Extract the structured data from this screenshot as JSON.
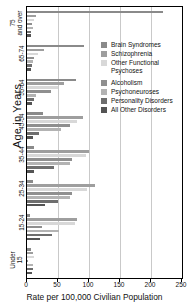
{
  "chart_data": {
    "type": "bar",
    "orientation": "horizontal",
    "title": "",
    "xlabel": "Rate per 100,000 Civilian Population",
    "ylabel": "Age in Years",
    "xlim": [
      0,
      250
    ],
    "xticks": [
      0,
      50,
      100,
      150,
      200,
      250
    ],
    "grid": "vertical",
    "legend_position": "upper-right-inside",
    "categories": [
      "75 and over",
      "65-74",
      "55-64",
      "45-54",
      "35-44",
      "25-34",
      "15-24",
      "Under 15"
    ],
    "series": [
      {
        "name": "Brain Syndromes",
        "color": "#8a8a8a",
        "values": [
          220,
          92,
          79,
          25,
          11,
          9,
          5,
          7
        ]
      },
      {
        "name": "Schizophrenia",
        "color": "#9e9e9e",
        "values": [
          14,
          28,
          59,
          90,
          100,
          110,
          81,
          9
        ]
      },
      {
        "name": "Other Functional Psychoses",
        "color": "#d8d8d8",
        "values": [
          12,
          17,
          50,
          80,
          95,
          96,
          77,
          12
        ]
      },
      {
        "name": "Alcoholism",
        "color": "#8f8f8f",
        "values": [
          8,
          11,
          38,
          70,
          73,
          72,
          24,
          1
        ]
      },
      {
        "name": "Psychoneuroses",
        "color": "#b3b3b3",
        "values": [
          9,
          9,
          15,
          55,
          70,
          70,
          52,
          9
        ]
      },
      {
        "name": "Personality Disorders",
        "color": "#6e6e6e",
        "values": [
          7,
          8,
          11,
          19,
          43,
          50,
          40,
          10
        ]
      },
      {
        "name": "All Other Disorders",
        "color": "#545454",
        "values": [
          6,
          7,
          8,
          9,
          12,
          29,
          21,
          8
        ]
      }
    ]
  },
  "legend": {
    "items": [
      {
        "label": "Brain Syndromes"
      },
      {
        "label": "Schizophrenia"
      },
      {
        "label": "Other Functional Psychoses"
      },
      {
        "label": "Alcoholism"
      },
      {
        "label": "Psychoneuroses"
      },
      {
        "label": "Personality Disorders"
      },
      {
        "label": "All Other Disorders"
      }
    ]
  }
}
